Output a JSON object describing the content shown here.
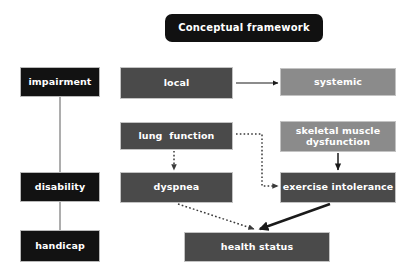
{
  "diagram": {
    "title": "Conceptual framework",
    "background_color": "#ffffff",
    "colors": {
      "title_banner": "#111111",
      "black_node": "#121212",
      "dark_gray_node": "#4a4a4a",
      "light_gray_node": "#8b8b8b",
      "node_border": "#c3c3c3",
      "solid_arrow": "#1a1a1a",
      "dotted_arrow": "#3a3a3a",
      "connector_line": "#8a8a8a",
      "node_text": "#ffffff"
    },
    "nodes": [
      {
        "id": "title",
        "label": "Conceptual framework",
        "style": "title",
        "x": 165,
        "y": 14,
        "w": 158,
        "h": 28
      },
      {
        "id": "impairment",
        "label": "impairment",
        "style": "black",
        "x": 20,
        "y": 67,
        "w": 80,
        "h": 30
      },
      {
        "id": "disability",
        "label": "disability",
        "style": "black",
        "x": 20,
        "y": 172,
        "w": 80,
        "h": 30
      },
      {
        "id": "handicap",
        "label": "handicap",
        "style": "black",
        "x": 20,
        "y": 230,
        "w": 80,
        "h": 32
      },
      {
        "id": "local",
        "label": "local",
        "style": "dark",
        "x": 120,
        "y": 67,
        "w": 113,
        "h": 32
      },
      {
        "id": "systemic",
        "label": "systemic",
        "style": "light",
        "x": 280,
        "y": 68,
        "w": 116,
        "h": 28
      },
      {
        "id": "lung-function",
        "label": "lung  function",
        "style": "dark",
        "x": 120,
        "y": 122,
        "w": 113,
        "h": 28
      },
      {
        "id": "skeletal-muscle",
        "label": "skeletal muscle dysfunction",
        "style": "light",
        "x": 280,
        "y": 121,
        "w": 116,
        "h": 31
      },
      {
        "id": "dyspnea",
        "label": "dyspnea",
        "style": "dark",
        "x": 120,
        "y": 172,
        "w": 113,
        "h": 31
      },
      {
        "id": "exercise-intolerance",
        "label": "exercise intolerance",
        "style": "dark",
        "x": 280,
        "y": 172,
        "w": 116,
        "h": 31
      },
      {
        "id": "health-status",
        "label": "health status",
        "style": "dark",
        "x": 184,
        "y": 232,
        "w": 146,
        "h": 30
      }
    ],
    "edges": [
      {
        "id": "impairment-to-disability",
        "from": "impairment",
        "to": "disability",
        "kind": "line"
      },
      {
        "id": "disability-to-handicap",
        "from": "disability",
        "to": "handicap",
        "kind": "line"
      },
      {
        "id": "local-to-systemic",
        "from": "local",
        "to": "systemic",
        "kind": "solid"
      },
      {
        "id": "lung-function-to-dyspnea",
        "from": "lung function",
        "to": "dyspnea",
        "kind": "dotted"
      },
      {
        "id": "lung-function-to-exercise",
        "from": "lung function",
        "to": "exercise intolerance",
        "kind": "dotted"
      },
      {
        "id": "skeletal-muscle-to-exercise",
        "from": "skeletal muscle dysfunction",
        "to": "exercise intolerance",
        "kind": "solid"
      },
      {
        "id": "dyspnea-to-health-status",
        "from": "dyspnea",
        "to": "health status",
        "kind": "dotted"
      },
      {
        "id": "exercise-to-health-status",
        "from": "exercise intolerance",
        "to": "health status",
        "kind": "solid"
      }
    ]
  }
}
